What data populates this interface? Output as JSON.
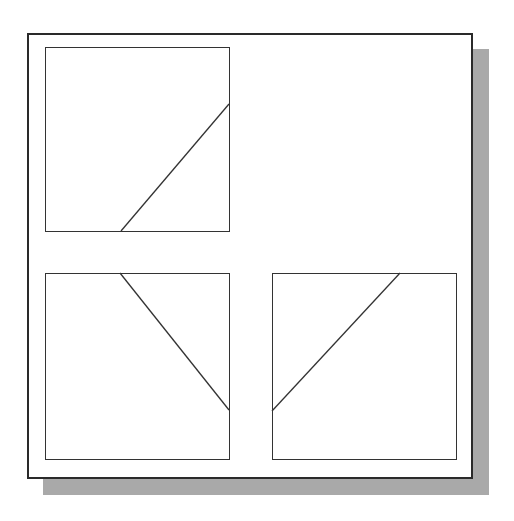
{
  "diagram": {
    "colors": {
      "frame_border": "#2a2a2a",
      "viewport_border": "#333333",
      "line": "#333333",
      "shadow": "#a9a9a9",
      "background": "#ffffff"
    },
    "sheet": {
      "x": 27,
      "y": 33,
      "width": 446,
      "height": 446,
      "shadow_offset": 16
    },
    "viewports": [
      {
        "name": "top-left",
        "x": 45,
        "y": 47,
        "width": 185,
        "height": 185,
        "line": {
          "x1": 121,
          "y1": 231,
          "x2": 229,
          "y2": 104
        }
      },
      {
        "name": "bottom-left",
        "x": 45,
        "y": 273,
        "width": 185,
        "height": 187,
        "line": {
          "x1": 120,
          "y1": 273,
          "x2": 229,
          "y2": 410
        }
      },
      {
        "name": "bottom-right",
        "x": 272,
        "y": 273,
        "width": 185,
        "height": 187,
        "line": {
          "x1": 400,
          "y1": 273,
          "x2": 272,
          "y2": 411
        }
      }
    ]
  }
}
